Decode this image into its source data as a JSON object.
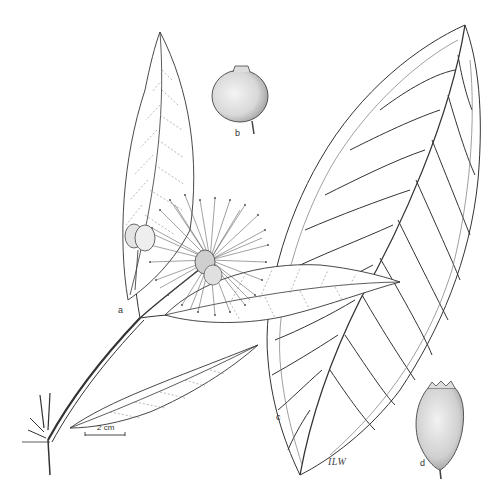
{
  "plate": {
    "subject": "Botanical line illustration of a flowering branch with leaves, flower and fruits",
    "labels": {
      "a": "a",
      "b": "b",
      "c": "c",
      "d": "d"
    },
    "scale_bar": "2 cm",
    "signature": "ILW"
  },
  "colors": {
    "background": "#ffffff",
    "ink": "#333333",
    "fruit_fill": "#e6e6e6",
    "fine_vein": "#9a9a9a"
  }
}
